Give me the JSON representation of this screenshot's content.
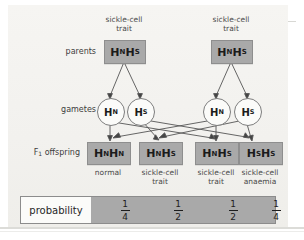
{
  "diagram": {
    "title_row_labels": {
      "parents": "parents",
      "gametes": "gametes",
      "offspring": "F",
      "offspring_sub": "1",
      "offspring_rest": " offspring"
    },
    "parents": [
      {
        "caption": "sickle-cell\ntrait",
        "allele1": "H",
        "sub1": "N",
        "allele2": "H",
        "sub2": "S"
      },
      {
        "caption": "sickle-cell\ntrait",
        "allele1": "H",
        "sub1": "N",
        "allele2": "H",
        "sub2": "S"
      }
    ],
    "gametes": [
      {
        "allele": "H",
        "sub": "N"
      },
      {
        "allele": "H",
        "sub": "S"
      },
      {
        "allele": "H",
        "sub": "N"
      },
      {
        "allele": "H",
        "sub": "S"
      }
    ],
    "offspring": [
      {
        "allele1": "H",
        "sub1": "N",
        "allele2": "H",
        "sub2": "N",
        "phenotype": "normal"
      },
      {
        "allele1": "H",
        "sub1": "N",
        "allele2": "H",
        "sub2": "S",
        "phenotype": "sickle-cell\ntrait"
      },
      {
        "allele1": "H",
        "sub1": "N",
        "allele2": "H",
        "sub2": "S",
        "phenotype": "sickle-cell\ntrait"
      },
      {
        "allele1": "H",
        "sub1": "S",
        "allele2": "H",
        "sub2": "S",
        "phenotype": "sickle-cell\nanaemia"
      }
    ],
    "probability": {
      "label": "probability",
      "values": [
        {
          "numerator": "1",
          "denominator": "4"
        },
        {
          "numerator": "1",
          "denominator": "2"
        },
        {
          "numerator": "1",
          "denominator": "2"
        },
        {
          "numerator": "1",
          "denominator": "4"
        }
      ]
    },
    "colors": {
      "genotype_box_fill": "#a9a9a9",
      "gamete_circle_fill": "#fbfbf9",
      "canvas_background": "#f3f2ef",
      "line": "#555555",
      "text": "#1b1b1b"
    }
  }
}
